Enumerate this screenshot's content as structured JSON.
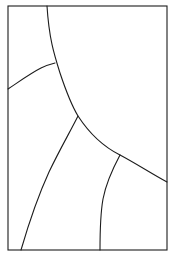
{
  "figure": {
    "title": "",
    "background_color": "#ffffff",
    "stroke_color": "#1c1c1c",
    "stroke_width": 1.1,
    "canvas": {
      "width": 175,
      "height": 266
    },
    "frame": {
      "name": "bounding-rectangle",
      "x": 8,
      "y": 6,
      "width": 159,
      "height": 244
    },
    "curves": [
      {
        "name": "main-arc",
        "description": "large arc entering from top border, bending right and down to the right border",
        "start": [
          47,
          6
        ],
        "end": [
          167,
          182
        ],
        "via": [
          [
            55,
            63
          ],
          [
            78,
            116
          ],
          [
            120,
            155
          ]
        ],
        "path": "M 47 6 C 49 38 54 54 60 73 C 67 94 72 106 78 116 C 91 136 104 147 120 155 C 137 164 152 174 167 182"
      },
      {
        "name": "upper-left-arc",
        "description": "arc from left border rising to meet the main arc",
        "start": [
          8,
          89
        ],
        "end": [
          55,
          63
        ],
        "via": [
          [
            30,
            74
          ]
        ],
        "path": "M 8 89 C 20 81 31 73 41 68 C 47 65 51 64 55 63"
      },
      {
        "name": "lower-left-branch",
        "description": "branch leaving the main arc junction and curving down-left to the bottom border",
        "start": [
          78,
          116
        ],
        "end": [
          21,
          250
        ],
        "via": [
          [
            52,
            165
          ]
        ],
        "path": "M 78 116 C 70 132 60 149 49 172 C 38 196 28 226 21 250"
      },
      {
        "name": "lower-right-branch",
        "description": "branch leaving the main arc and descending to the bottom border",
        "start": [
          120,
          155
        ],
        "end": [
          100,
          250
        ],
        "via": [
          [
            104,
            200
          ]
        ],
        "path": "M 120 155 C 112 170 106 183 103 199 C 100 216 100 235 100 250"
      }
    ],
    "junctions": [
      {
        "name": "upper-junction",
        "point": [
          55,
          63
        ]
      },
      {
        "name": "center-y-junction",
        "point": [
          78,
          116
        ]
      },
      {
        "name": "right-branch-junction",
        "point": [
          120,
          155
        ]
      }
    ],
    "regions": [
      {
        "name": "region-top-left",
        "label": ""
      },
      {
        "name": "region-left-middle",
        "label": ""
      },
      {
        "name": "region-right-upper",
        "label": ""
      },
      {
        "name": "region-bottom-left",
        "label": ""
      },
      {
        "name": "region-bottom-center",
        "label": ""
      },
      {
        "name": "region-bottom-right",
        "label": ""
      }
    ]
  }
}
